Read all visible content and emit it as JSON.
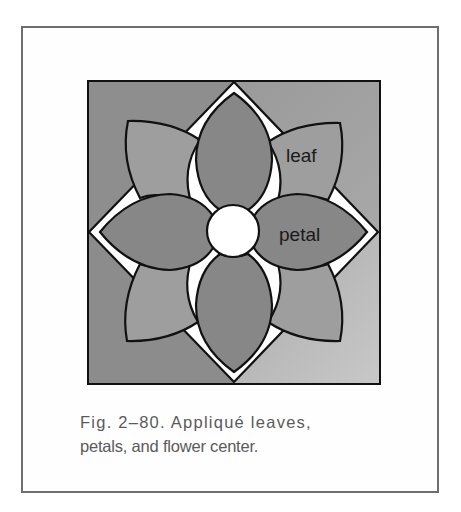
{
  "figure": {
    "labels": {
      "leaf": "leaf",
      "petal": "petal"
    },
    "caption": {
      "line1": "Fig. 2–80. Appliqué leaves,",
      "line2": "petals, and flower center."
    },
    "colors": {
      "frame_border": "#6e6e6e",
      "background_top_left": "#8e8e8e",
      "background_top_right": "#a3a3a3",
      "background_bottom_left": "#8c8c8c",
      "background_bottom_right": "#bdbdbd",
      "diamond": "#ffffff",
      "leaf": "#9e9e9e",
      "petal": "#878787",
      "center": "#ffffff",
      "outline": "#111111",
      "caption_text": "#5a5a5a"
    },
    "parts": [
      "leaf",
      "petal",
      "flower center"
    ]
  }
}
